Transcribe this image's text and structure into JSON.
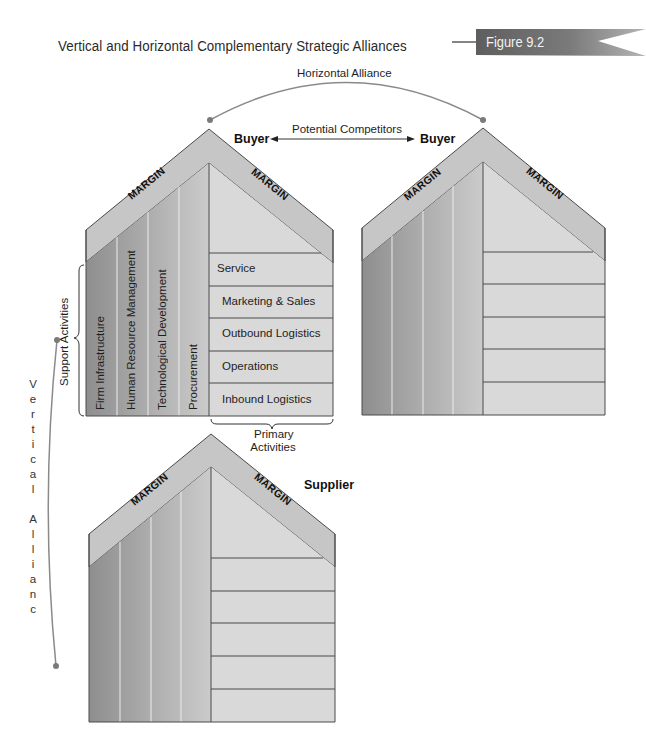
{
  "header": {
    "title": "Vertical and Horizontal Complementary Strategic Alliances",
    "figure_label": "Figure 9.2"
  },
  "alliances": {
    "horizontal": "Horizontal Alliance",
    "vertical_letters": [
      "V",
      "e",
      "r",
      "t",
      "i",
      "c",
      "a",
      "l",
      "",
      "A",
      "l",
      "l",
      "i",
      "a",
      "n",
      "c",
      "e"
    ],
    "vertical": "Vertical Alliance",
    "competitors": "Potential Competitors"
  },
  "houses": {
    "buyer1": {
      "name": "Buyer",
      "margin_left": "MARGIN",
      "margin_right": "MARGIN",
      "support_activities": [
        "Firm Infrastructure",
        "Human Resource Management",
        "Technological Development",
        "Procurement"
      ],
      "primary_activities": [
        "Service",
        "Marketing & Sales",
        "Outbound Logistics",
        "Operations",
        "Inbound Logistics"
      ]
    },
    "buyer2": {
      "name": "Buyer",
      "margin_left": "MARGIN",
      "margin_right": "MARGIN"
    },
    "supplier": {
      "name": "Supplier",
      "margin_left": "MARGIN",
      "margin_right": "MARGIN"
    }
  },
  "brackets": {
    "support": "Support Activities",
    "primary_line1": "Primary",
    "primary_line2": "Activities"
  },
  "colors": {
    "margin_band": "#c6c6c6",
    "primary_area": "#d9d9d9",
    "support_dark": "#8f8f8f",
    "support_light": "#cacaca",
    "outline": "#4a4a4a",
    "connector": "#8a8a8a",
    "badge": "#6a6a6a"
  }
}
